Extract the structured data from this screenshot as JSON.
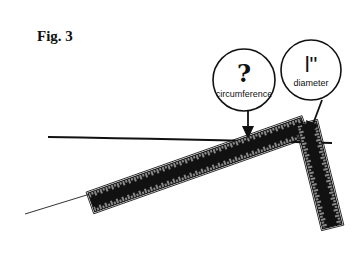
{
  "figure": {
    "title": "Fig. 3",
    "callouts": [
      {
        "symbol": "?",
        "label": "circumference"
      },
      {
        "symbol": "l\"",
        "label": "diameter"
      }
    ],
    "colors": {
      "ink": "#111111",
      "background": "#ffffff"
    }
  }
}
